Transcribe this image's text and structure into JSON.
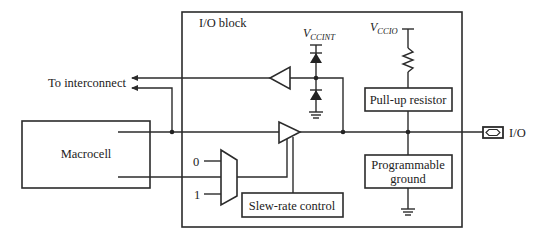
{
  "diagram": {
    "title": "I/O block",
    "blocks": {
      "io_block": "I/O block",
      "macrocell": "Macrocell",
      "pull_up": "Pull-up resistor",
      "prog_ground_line1": "Programmable",
      "prog_ground_line2": "ground",
      "slew_rate": "Slew-rate control"
    },
    "labels": {
      "to_interconnect": "To interconnect",
      "io_pin": "I/O",
      "mux_in0": "0",
      "mux_in1": "1",
      "vccint_v": "V",
      "vccint_sub": "CCINT",
      "vccio_v": "V",
      "vccio_sub": "CCIO"
    },
    "colors": {
      "stroke": "#2b2b2b",
      "text": "#222222",
      "background": "#ffffff"
    }
  }
}
